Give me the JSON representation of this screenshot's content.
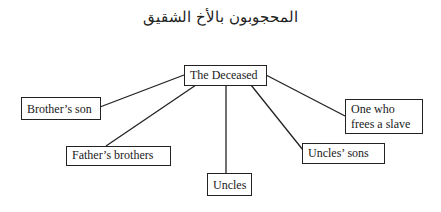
{
  "title": "المحجوبون بالأخ الشقيق",
  "nodes": {
    "root": {
      "label": "The Deceased"
    },
    "brothers_son": {
      "label": "Brother’s son"
    },
    "fathers_brothers": {
      "label": "Father’s brothers"
    },
    "uncles": {
      "label": "Uncles"
    },
    "uncles_sons": {
      "label": "Uncles’ sons"
    },
    "freer_line1": {
      "label": "One who"
    },
    "freer_line2": {
      "label": "frees a slave"
    }
  }
}
